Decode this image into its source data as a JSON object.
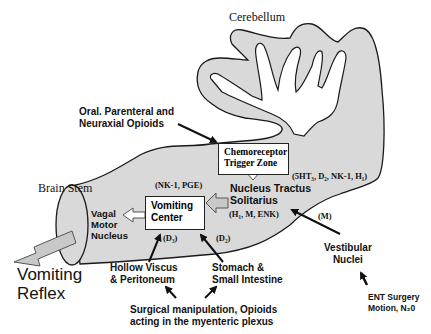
{
  "diagram": {
    "regions": {
      "cerebellum": "Cerebellum",
      "brain_stem": "Brain Stem"
    },
    "boxes": {
      "ctz": {
        "line1": "Chemoreceptor",
        "line2": "Trigger Zone"
      },
      "vomiting_center": {
        "line1": "Vomiting",
        "line2": "Center"
      }
    },
    "nodes": {
      "nts": {
        "line1": "Nucleus Tractus",
        "line2": "Solitarius",
        "receptors": "(H₁, M, ENK)"
      },
      "vagal": {
        "line1": "Vagal",
        "line2": "Motor",
        "line3": "Nucleus"
      },
      "vestibular": {
        "line1": "Vestibular",
        "line2": "Nuclei"
      },
      "hollow_viscus": {
        "line1": "Hollow Viscus",
        "line2": "& Peritoneum"
      },
      "stomach": {
        "line1": "Stomach &",
        "line2": "Small Intestine"
      },
      "vomiting_reflex": {
        "line1": "Vomiting",
        "line2": "Reflex"
      }
    },
    "receptor_labels": {
      "vc": "(NK-1, PGE)",
      "ctz": "(5HT₃, D₂, NK-1, H₁)",
      "d_left": "(D₃)",
      "d_right": "(D₂)",
      "vestibular": "(M)"
    },
    "stimuli": {
      "opioids": {
        "line1": "Oral. Parenteral and",
        "line2": "Neuraxial Opioids"
      },
      "surgical": {
        "line1": "Surgical manipulation, Opioids",
        "line2": "acting in the myenteric plexus"
      },
      "ent": {
        "line1": "ENT Surgery",
        "line2": "Motion, N₂0"
      }
    },
    "colors": {
      "fill": "#d9d9d9",
      "outline": "#1a1a1a",
      "arrow_fill": "#c8c8c8",
      "text": "#111111"
    }
  }
}
